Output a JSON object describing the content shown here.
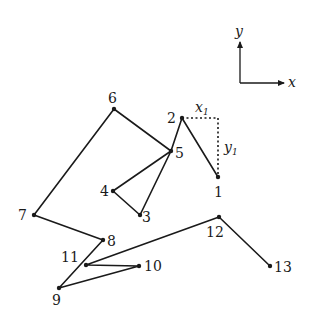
{
  "diagram": {
    "type": "path-with-coordinate-axes",
    "stroke_color": "#1a1a1a",
    "points": [
      {
        "id": "1",
        "label": "1",
        "x": 218,
        "y": 177,
        "lx": 214,
        "ly": 197
      },
      {
        "id": "2",
        "label": "2",
        "x": 182,
        "y": 118,
        "lx": 167,
        "ly": 123
      },
      {
        "id": "3",
        "label": "3",
        "x": 140,
        "y": 215,
        "lx": 142,
        "ly": 222
      },
      {
        "id": "4",
        "label": "4",
        "x": 113,
        "y": 191,
        "lx": 100,
        "ly": 196
      },
      {
        "id": "5",
        "label": "5",
        "x": 171,
        "y": 151,
        "lx": 175,
        "ly": 158
      },
      {
        "id": "6",
        "label": "6",
        "x": 114,
        "y": 109,
        "lx": 108,
        "ly": 103
      },
      {
        "id": "7",
        "label": "7",
        "x": 34,
        "y": 215,
        "lx": 18,
        "ly": 220
      },
      {
        "id": "8",
        "label": "8",
        "x": 103,
        "y": 240,
        "lx": 107,
        "ly": 246
      },
      {
        "id": "9",
        "label": "9",
        "x": 59,
        "y": 288,
        "lx": 52,
        "ly": 305
      },
      {
        "id": "10",
        "label": "10",
        "x": 139,
        "y": 266,
        "lx": 144,
        "ly": 271
      },
      {
        "id": "11",
        "label": "11",
        "x": 86,
        "y": 265,
        "lx": 61,
        "ly": 262
      },
      {
        "id": "12",
        "label": "12",
        "x": 219,
        "y": 217,
        "lx": 206,
        "ly": 237
      },
      {
        "id": "13",
        "label": "13",
        "x": 270,
        "y": 266,
        "lx": 274,
        "ly": 272
      }
    ],
    "path_order": [
      "1",
      "2",
      "5",
      "3",
      "4",
      "5",
      "6",
      "7",
      "8",
      "9",
      "10",
      "11",
      "12",
      "13"
    ],
    "displacement": {
      "from": "2",
      "corner": {
        "x": 218,
        "y": 118
      },
      "to": "1",
      "x_label": "x",
      "x_sub": "1",
      "y_label": "y",
      "y_sub": "1"
    },
    "axes": {
      "origin": {
        "x": 240,
        "y": 83
      },
      "y_tip": {
        "x": 240,
        "y": 42
      },
      "x_tip": {
        "x": 284,
        "y": 83
      },
      "x_label": "x",
      "y_label": "y"
    }
  }
}
